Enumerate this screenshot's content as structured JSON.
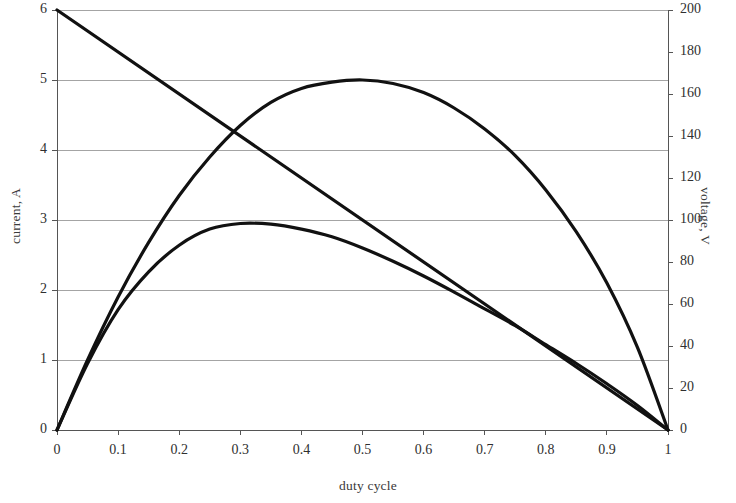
{
  "chart_data": {
    "type": "line",
    "title": "",
    "xlabel": "duty cycle",
    "ylabel": "current, A",
    "y2label": "voltage, V",
    "xlim": [
      0,
      1
    ],
    "ylim": [
      0,
      6
    ],
    "y2lim": [
      0,
      200
    ],
    "grid": true,
    "legend": "none",
    "x_ticks": [
      "0",
      "0.1",
      "0.2",
      "0.3",
      "0.4",
      "0.5",
      "0.6",
      "0.7",
      "0.8",
      "0.9",
      "1"
    ],
    "x_tick_values": [
      0,
      0.1,
      0.2,
      0.3,
      0.4,
      0.5,
      0.6,
      0.7,
      0.8,
      0.9,
      1
    ],
    "y_ticks": [
      "0",
      "1",
      "2",
      "3",
      "4",
      "5",
      "6"
    ],
    "y_tick_values": [
      0,
      1,
      2,
      3,
      4,
      5,
      6
    ],
    "y2_ticks": [
      "0",
      "20",
      "40",
      "60",
      "80",
      "100",
      "120",
      "140",
      "160",
      "180",
      "200"
    ],
    "y2_tick_values": [
      0,
      20,
      40,
      60,
      80,
      100,
      120,
      140,
      160,
      180,
      200
    ],
    "line_color": "#111111",
    "grid_color": "#9a9a9a",
    "axis_color": "#555555",
    "background": "#ffffff",
    "x": [
      0,
      0.05,
      0.1,
      0.15,
      0.2,
      0.25,
      0.3,
      0.35,
      0.4,
      0.45,
      0.5,
      0.55,
      0.6,
      0.65,
      0.7,
      0.75,
      0.8,
      0.85,
      0.9,
      0.95,
      1
    ],
    "series": [
      {
        "name": "voltage",
        "axis": "right",
        "units": "V",
        "values_right_axis": [
          200,
          190,
          180,
          170,
          160,
          150,
          140,
          130,
          120,
          110,
          100,
          90,
          80,
          70,
          60,
          50,
          40,
          30,
          20,
          10,
          0
        ],
        "values": [
          6,
          5.7,
          5.4,
          5.1,
          4.8,
          4.5,
          4.2,
          3.9,
          3.6,
          3.3,
          3.0,
          2.7,
          2.4,
          2.1,
          1.8,
          1.5,
          1.2,
          0.9,
          0.6,
          0.3,
          0
        ]
      },
      {
        "name": "current-upper",
        "axis": "left",
        "units": "A",
        "peak_x": 0.5,
        "peak_y": 5.0,
        "values": [
          0,
          1.0,
          1.9,
          2.68,
          3.35,
          3.9,
          4.35,
          4.68,
          4.88,
          4.97,
          5.0,
          4.95,
          4.82,
          4.6,
          4.3,
          3.92,
          3.43,
          2.83,
          2.1,
          1.18,
          0
        ]
      },
      {
        "name": "current-lower",
        "axis": "left",
        "units": "A",
        "peak_x": 0.333,
        "peak_y": 2.96,
        "values": [
          0,
          0.95,
          1.72,
          2.26,
          2.64,
          2.87,
          2.95,
          2.94,
          2.87,
          2.76,
          2.6,
          2.41,
          2.2,
          1.97,
          1.73,
          1.49,
          1.22,
          0.95,
          0.66,
          0.35,
          0
        ]
      }
    ],
    "annotations": []
  },
  "geometry": {
    "plot_left": 57,
    "plot_right": 668,
    "plot_top": 10,
    "plot_bottom": 430
  }
}
